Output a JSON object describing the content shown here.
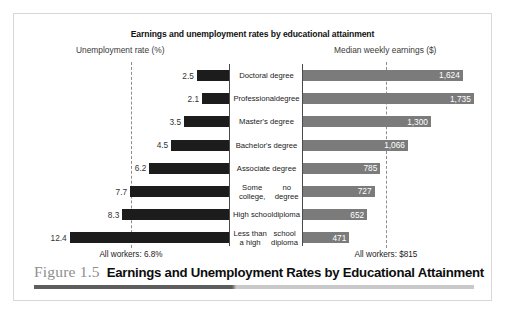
{
  "chart_data": {
    "type": "bar",
    "title": "Earnings and unemployment rates by educational attainment",
    "left_panel": {
      "axis_title": "Unemployment rate (%)",
      "unit": "%",
      "xlabel": "Unemployment rate (%)",
      "average_label": "All workers: 6.8%",
      "average_value": 6.8,
      "xlim": [
        0,
        13
      ],
      "direction": "right-to-left"
    },
    "right_panel": {
      "axis_title": "Median weekly earnings ($)",
      "unit": "$",
      "xlabel": "Median weekly earnings ($)",
      "average_label": "All workers: $815",
      "average_value": 815,
      "xlim": [
        0,
        1900
      ],
      "direction": "left-to-right"
    },
    "categories": [
      "Doctoral degree",
      "Professional degree",
      "Master's degree",
      "Bachelor's degree",
      "Associate degree",
      "Some college, no degree",
      "High school diploma",
      "Less than a high school diploma"
    ],
    "series": [
      {
        "name": "Unemployment rate (%)",
        "values": [
          2.5,
          2.1,
          3.5,
          4.5,
          6.2,
          7.7,
          8.3,
          12.4
        ],
        "color": "#1c1c1c"
      },
      {
        "name": "Median weekly earnings ($)",
        "values": [
          1624,
          1735,
          1300,
          1066,
          785,
          727,
          652,
          471
        ],
        "color": "#7b7b7b"
      }
    ],
    "grid": false,
    "legend": "none"
  },
  "rows": [
    {
      "label_line1": "Doctoral degree",
      "label_line2": "",
      "rate_label": "2.5",
      "rate": 2.5,
      "earnings_label": "1,624",
      "earnings": 1624
    },
    {
      "label_line1": "Professional",
      "label_line2": "degree",
      "rate_label": "2.1",
      "rate": 2.1,
      "earnings_label": "1,735",
      "earnings": 1735
    },
    {
      "label_line1": "Master's degree",
      "label_line2": "",
      "rate_label": "3.5",
      "rate": 3.5,
      "earnings_label": "1,300",
      "earnings": 1300
    },
    {
      "label_line1": "Bachelor's degree",
      "label_line2": "",
      "rate_label": "4.5",
      "rate": 4.5,
      "earnings_label": "1,066",
      "earnings": 1066
    },
    {
      "label_line1": "Associate degree",
      "label_line2": "",
      "rate_label": "6.2",
      "rate": 6.2,
      "earnings_label": "785",
      "earnings": 785
    },
    {
      "label_line1": "Some college,",
      "label_line2": "no degree",
      "rate_label": "7.7",
      "rate": 7.7,
      "earnings_label": "727",
      "earnings": 727
    },
    {
      "label_line1": "High school",
      "label_line2": "diploma",
      "rate_label": "8.3",
      "rate": 8.3,
      "earnings_label": "652",
      "earnings": 652
    },
    {
      "label_line1": "Less than a high",
      "label_line2": "school diploma",
      "rate_label": "12.4",
      "rate": 12.4,
      "earnings_label": "471",
      "earnings": 471
    }
  ],
  "caption": {
    "figure_number": "Figure 1.5",
    "title": "Earnings and Unemployment Rates by Educational Attainment"
  },
  "colors": {
    "unemployment_bar": "#1c1c1c",
    "earnings_bar": "#7b7b7b",
    "axis": "#4a4a4a",
    "dashed_reference": "#8d8d8d",
    "figure_number": "#8e8e8e",
    "rule_dark": "#5e5e5e",
    "rule_light": "#c9c9c9",
    "frame_border": "#d8d8d8"
  }
}
